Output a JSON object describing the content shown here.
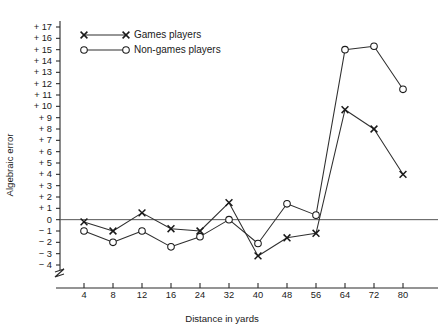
{
  "chart_data": {
    "type": "line",
    "title": "",
    "subtitle": "",
    "xlabel": "Distance in yards",
    "ylabel": "Algebraic error",
    "categories": [
      "4",
      "8",
      "12",
      "16",
      "24",
      "32",
      "40",
      "48",
      "56",
      "64",
      "72",
      "80"
    ],
    "x_tick_labels": [
      "4",
      "8",
      "12",
      "16",
      "24",
      "32",
      "40",
      "48",
      "56",
      "64",
      "72",
      "80"
    ],
    "y_tick_labels": [
      "+ 17",
      "+ 16",
      "+ 15",
      "+ 14",
      "+ 13",
      "+ 12",
      "+ 11",
      "+ 10",
      "+ 9",
      "+ 8",
      "+ 7",
      "+ 6",
      "+ 5",
      "+ 4",
      "+ 3",
      "+ 2",
      "+ 1",
      "0",
      "− 1",
      "− 2",
      "− 3",
      "− 4"
    ],
    "y_tick_values": [
      17,
      16,
      15,
      14,
      13,
      12,
      11,
      10,
      9,
      8,
      7,
      6,
      5,
      4,
      3,
      2,
      1,
      0,
      -1,
      -2,
      -3,
      -4
    ],
    "ylim": [
      -4,
      17
    ],
    "grid": false,
    "zero_line": true,
    "axis_break": true,
    "legend_position": "top-left",
    "series": [
      {
        "name": "Games players",
        "marker": "cross",
        "values": [
          -0.2,
          -1.0,
          0.6,
          -0.8,
          -1.0,
          1.5,
          -3.2,
          -1.6,
          -1.2,
          9.7,
          8.0,
          4.0
        ]
      },
      {
        "name": "Non-games players",
        "marker": "circle",
        "values": [
          -1.0,
          -2.0,
          -1.0,
          -2.4,
          -1.5,
          0.0,
          -2.1,
          1.4,
          0.4,
          15.0,
          15.3,
          11.5
        ]
      }
    ]
  },
  "legend": {
    "entries": [
      {
        "label": "Games players",
        "marker": "cross"
      },
      {
        "label": "Non-games players",
        "marker": "circle"
      }
    ]
  },
  "axes": {
    "x_title": "Distance in yards",
    "y_title": "Algebraic error"
  }
}
